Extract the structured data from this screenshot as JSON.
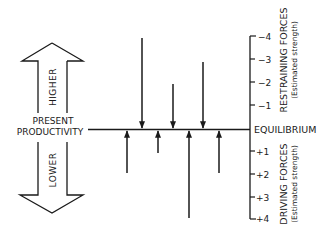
{
  "diagram": {
    "type": "force-field-analysis",
    "left_arrow": {
      "top_label": "HIGHER",
      "bottom_label": "LOWER",
      "center_label_line1": "PRESENT",
      "center_label_line2": "PRODUCTIVITY"
    },
    "equilibrium_label": "EQUILIBRIUM",
    "restraining": {
      "title": "RESTRAINING FORCES",
      "subtitle": "(Estimated strength)",
      "ticks": [
        "−4",
        "−3",
        "−2",
        "−1"
      ],
      "forces": [
        4,
        2,
        3
      ]
    },
    "driving": {
      "title": "DRIVING FORCES",
      "subtitle": "(Estimated strength)",
      "ticks": [
        "+1",
        "+2",
        "+3",
        "+4"
      ],
      "forces": [
        2,
        1,
        4,
        2
      ]
    }
  }
}
